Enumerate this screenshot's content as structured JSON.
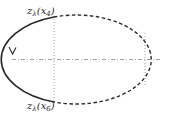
{
  "diagram": {
    "labels": {
      "top": {
        "base": "z",
        "base_sub": "λ",
        "arg": "x",
        "arg_sub": "4"
      },
      "bottom": {
        "base": "z",
        "base_sub": "λ",
        "arg": "x",
        "arg_sub": "6"
      }
    },
    "colors": {
      "stroke": "#2a2a2a",
      "guide": "#8a8a8a",
      "background": "#ffffff"
    },
    "ellipse": {
      "cx": 87,
      "cy": 59.5,
      "rx": 75,
      "ry": 44.5
    },
    "solid_arc": "left",
    "dashed_arc": "right",
    "arrow_direction": "down"
  }
}
